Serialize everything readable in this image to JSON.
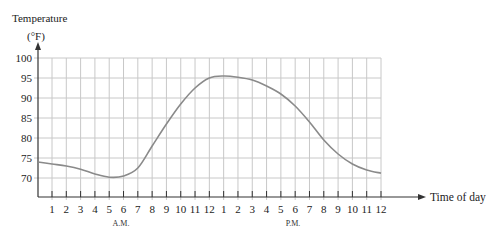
{
  "chart_data": {
    "type": "line",
    "title": "",
    "ylabel": "Temperature",
    "ylabel_unit": "(°F)",
    "xlabel": "Time of day",
    "ylim": [
      65,
      100
    ],
    "yticks": [
      70,
      75,
      80,
      85,
      90,
      95,
      100
    ],
    "grid": true,
    "legend": null,
    "x_tick_labels": [
      "1",
      "2",
      "3",
      "4",
      "5",
      "6",
      "7",
      "8",
      "9",
      "10",
      "11",
      "12",
      "1",
      "2",
      "3",
      "4",
      "5",
      "6",
      "7",
      "8",
      "9",
      "10",
      "11",
      "12"
    ],
    "x_group_labels": [
      {
        "label": "A.M.",
        "center_hour": 6
      },
      {
        "label": "P.M.",
        "center_hour": 18
      }
    ],
    "series": [
      {
        "name": "Temperature",
        "x": [
          0,
          1,
          2,
          3,
          4,
          5,
          6,
          7,
          8,
          9,
          10,
          11,
          12,
          13,
          14,
          15,
          16,
          17,
          18,
          19,
          20,
          21,
          22,
          23,
          24
        ],
        "values": [
          74,
          73.5,
          73,
          72.2,
          71,
          70.2,
          70.5,
          72.5,
          78,
          83.5,
          88.5,
          92.5,
          95,
          95.5,
          95.2,
          94.5,
          93,
          91,
          88,
          84,
          79.5,
          76,
          73.5,
          72,
          71.2
        ]
      }
    ]
  },
  "labels": {
    "ylabel": "Temperature",
    "yunit": "(°F)",
    "xlabel": "Time of day",
    "am": "A.M.",
    "pm": "P.M."
  },
  "colors": {
    "grid": "#c8c8c8",
    "axis": "#333333",
    "curve": "#8a8a8a"
  }
}
